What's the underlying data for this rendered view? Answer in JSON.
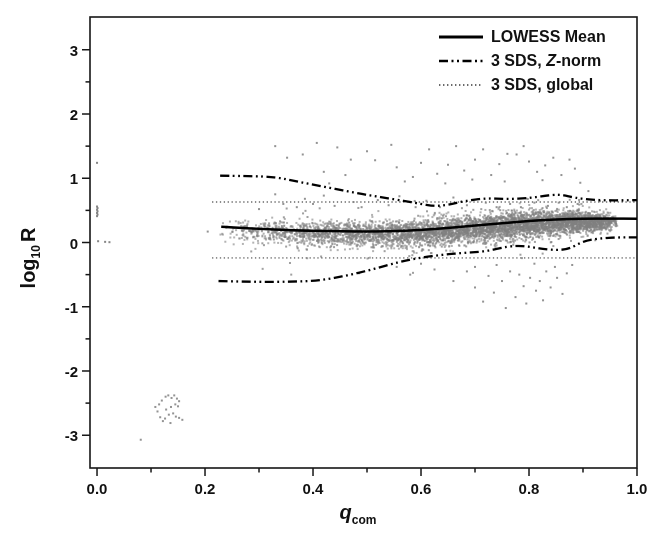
{
  "figure": {
    "background": "#ffffff",
    "frame_color": "#161616",
    "tick_color": "#161616"
  },
  "chart_data": {
    "type": "scatter",
    "title": "",
    "xlabel": "q_com",
    "xlabel_main": "q",
    "xlabel_sub": "com",
    "ylabel": "log10 R",
    "ylabel_main": "log",
    "ylabel_sub": "10",
    "ylabel_suffix": "R",
    "xlim": [
      -0.013,
      1.0
    ],
    "ylim": [
      -3.51,
      3.51
    ],
    "grid": false,
    "x_ticks": [
      {
        "v": 0.0,
        "label": "0.0"
      },
      {
        "v": 0.2,
        "label": "0.2"
      },
      {
        "v": 0.4,
        "label": "0.4"
      },
      {
        "v": 0.6,
        "label": "0.6"
      },
      {
        "v": 0.8,
        "label": "0.8"
      },
      {
        "v": 1.0,
        "label": "1.0"
      }
    ],
    "x_minor_ticks": [
      0.1,
      0.3,
      0.5,
      0.7,
      0.9
    ],
    "y_ticks": [
      {
        "v": 3,
        "label": "3"
      },
      {
        "v": 2,
        "label": "2"
      },
      {
        "v": 1,
        "label": "1"
      },
      {
        "v": 0,
        "label": "0"
      },
      {
        "v": -1,
        "label": "-1"
      },
      {
        "v": -2,
        "label": "-2"
      },
      {
        "v": -3,
        "label": "-3"
      }
    ],
    "y_minor_ticks": [
      2.5,
      1.5,
      0.5,
      -0.5,
      -1.5,
      -2.5
    ],
    "legend": {
      "position": "top-right",
      "entries": [
        {
          "label": "LOWESS Mean",
          "style": "solid"
        },
        {
          "label": "3 SDS, Z-norm",
          "prefix": "3 SDS, ",
          "italic": "Z",
          "suffix": "-norm",
          "style": "dashdotdot"
        },
        {
          "label": "3 SDS, global",
          "style": "dotted"
        }
      ]
    },
    "lines": [
      {
        "name": "3 SDS global upper",
        "style": "dotted",
        "width": 1.2,
        "color": "#4a4a4a",
        "points": [
          [
            0.213,
            0.63
          ],
          [
            1.0,
            0.63
          ]
        ]
      },
      {
        "name": "3 SDS global lower",
        "style": "dotted",
        "width": 1.2,
        "color": "#4a4a4a",
        "points": [
          [
            0.213,
            -0.24
          ],
          [
            1.0,
            -0.24
          ]
        ]
      },
      {
        "name": "3 SDS Z-norm upper",
        "style": "dashdotdot",
        "width": 2.3,
        "color": "#000000",
        "points": [
          [
            0.228,
            1.04
          ],
          [
            0.28,
            1.035
          ],
          [
            0.33,
            1.02
          ],
          [
            0.37,
            0.95
          ],
          [
            0.41,
            0.885
          ],
          [
            0.45,
            0.82
          ],
          [
            0.49,
            0.755
          ],
          [
            0.53,
            0.7
          ],
          [
            0.57,
            0.645
          ],
          [
            0.6,
            0.6
          ],
          [
            0.625,
            0.565
          ],
          [
            0.65,
            0.585
          ],
          [
            0.68,
            0.645
          ],
          [
            0.72,
            0.69
          ],
          [
            0.76,
            0.675
          ],
          [
            0.8,
            0.69
          ],
          [
            0.84,
            0.74
          ],
          [
            0.86,
            0.745
          ],
          [
            0.885,
            0.695
          ],
          [
            0.92,
            0.66
          ],
          [
            0.96,
            0.655
          ],
          [
            1.0,
            0.66
          ]
        ]
      },
      {
        "name": "3 SDS Z-norm lower",
        "style": "dashdotdot",
        "width": 2.3,
        "color": "#000000",
        "points": [
          [
            0.225,
            -0.6
          ],
          [
            0.3,
            -0.615
          ],
          [
            0.36,
            -0.61
          ],
          [
            0.41,
            -0.595
          ],
          [
            0.46,
            -0.52
          ],
          [
            0.51,
            -0.42
          ],
          [
            0.56,
            -0.3
          ],
          [
            0.6,
            -0.235
          ],
          [
            0.64,
            -0.19
          ],
          [
            0.68,
            -0.16
          ],
          [
            0.72,
            -0.14
          ],
          [
            0.76,
            -0.06
          ],
          [
            0.79,
            -0.05
          ],
          [
            0.82,
            -0.095
          ],
          [
            0.85,
            -0.12
          ],
          [
            0.875,
            -0.1
          ],
          [
            0.9,
            0.02
          ],
          [
            0.93,
            0.065
          ],
          [
            0.965,
            0.08
          ],
          [
            1.0,
            0.08
          ]
        ]
      },
      {
        "name": "LOWESS Mean",
        "style": "solid",
        "width": 2.5,
        "color": "#000000",
        "points": [
          [
            0.23,
            0.245
          ],
          [
            0.27,
            0.225
          ],
          [
            0.32,
            0.205
          ],
          [
            0.38,
            0.185
          ],
          [
            0.44,
            0.175
          ],
          [
            0.5,
            0.17
          ],
          [
            0.55,
            0.175
          ],
          [
            0.6,
            0.195
          ],
          [
            0.65,
            0.225
          ],
          [
            0.7,
            0.265
          ],
          [
            0.75,
            0.3
          ],
          [
            0.8,
            0.335
          ],
          [
            0.85,
            0.36
          ],
          [
            0.9,
            0.37
          ],
          [
            0.95,
            0.372
          ],
          [
            1.0,
            0.37
          ]
        ]
      }
    ],
    "scatter": {
      "marker_color": "#808080",
      "marker_size": 2,
      "marker_alpha": 0.6,
      "band": {
        "count": 5200,
        "seed": 1234,
        "x_start": 0.225,
        "x_end": 0.965,
        "x_power": 0.55,
        "taper_start": 0.93,
        "taper_span": 0.042,
        "center_keys": [
          [
            0.225,
            0.195
          ],
          [
            0.3,
            0.165
          ],
          [
            0.4,
            0.135
          ],
          [
            0.5,
            0.125
          ],
          [
            0.6,
            0.145
          ],
          [
            0.7,
            0.215
          ],
          [
            0.8,
            0.285
          ],
          [
            0.88,
            0.32
          ],
          [
            0.965,
            0.325
          ]
        ],
        "sd_keys": [
          [
            0.225,
            0.085
          ],
          [
            0.4,
            0.095
          ],
          [
            0.6,
            0.105
          ],
          [
            0.8,
            0.1
          ],
          [
            0.88,
            0.085
          ],
          [
            0.965,
            0.06
          ]
        ],
        "halo_count": 260,
        "halo_sd_mult": 2.1
      },
      "outliers_above": [
        [
          0.33,
          1.5
        ],
        [
          0.352,
          1.32
        ],
        [
          0.381,
          1.37
        ],
        [
          0.407,
          1.55
        ],
        [
          0.42,
          1.1
        ],
        [
          0.445,
          1.48
        ],
        [
          0.47,
          1.29
        ],
        [
          0.43,
          0.92
        ],
        [
          0.46,
          1.05
        ],
        [
          0.5,
          1.42
        ],
        [
          0.515,
          1.28
        ],
        [
          0.545,
          1.52
        ],
        [
          0.555,
          1.17
        ],
        [
          0.57,
          0.95
        ],
        [
          0.585,
          1.02
        ],
        [
          0.6,
          1.24
        ],
        [
          0.615,
          1.45
        ],
        [
          0.63,
          1.07
        ],
        [
          0.645,
          0.92
        ],
        [
          0.65,
          1.21
        ],
        [
          0.665,
          1.5
        ],
        [
          0.68,
          1.12
        ],
        [
          0.695,
          0.98
        ],
        [
          0.7,
          1.29
        ],
        [
          0.715,
          1.45
        ],
        [
          0.73,
          1.05
        ],
        [
          0.745,
          1.22
        ],
        [
          0.755,
          0.95
        ],
        [
          0.76,
          1.38
        ],
        [
          0.777,
          1.37
        ],
        [
          0.79,
          1.5
        ],
        [
          0.8,
          1.26
        ],
        [
          0.815,
          1.1
        ],
        [
          0.825,
          0.97
        ],
        [
          0.83,
          1.2
        ],
        [
          0.845,
          1.32
        ],
        [
          0.86,
          1.05
        ],
        [
          0.875,
          1.29
        ],
        [
          0.885,
          1.15
        ],
        [
          0.895,
          0.93
        ],
        [
          0.91,
          0.8
        ],
        [
          0.3,
          0.52
        ],
        [
          0.33,
          0.75
        ],
        [
          0.345,
          0.6
        ],
        [
          0.37,
          0.55
        ],
        [
          0.385,
          0.68
        ],
        [
          0.4,
          0.6
        ],
        [
          0.42,
          0.73
        ],
        [
          0.44,
          0.57
        ],
        [
          0.475,
          0.63
        ],
        [
          0.49,
          0.55
        ],
        [
          0.52,
          0.66
        ],
        [
          0.54,
          0.58
        ],
        [
          0.56,
          0.72
        ],
        [
          0.59,
          0.55
        ],
        [
          0.61,
          0.65
        ],
        [
          0.635,
          0.55
        ],
        [
          0.66,
          0.7
        ],
        [
          0.685,
          0.58
        ],
        [
          0.72,
          0.62
        ],
        [
          0.74,
          0.55
        ],
        [
          0.765,
          0.6
        ],
        [
          0.785,
          0.55
        ],
        [
          0.81,
          0.62
        ],
        [
          0.835,
          0.57
        ],
        [
          0.855,
          0.62
        ],
        [
          0.87,
          0.55
        ],
        [
          0.89,
          0.6
        ]
      ],
      "outliers_below": [
        [
          0.555,
          -0.38
        ],
        [
          0.58,
          -0.5
        ],
        [
          0.6,
          -0.33
        ],
        [
          0.625,
          -0.42
        ],
        [
          0.66,
          -0.6
        ],
        [
          0.685,
          -0.45
        ],
        [
          0.7,
          -0.7
        ],
        [
          0.715,
          -0.92
        ],
        [
          0.725,
          -0.52
        ],
        [
          0.735,
          -0.78
        ],
        [
          0.75,
          -0.6
        ],
        [
          0.757,
          -1.02
        ],
        [
          0.765,
          -0.45
        ],
        [
          0.775,
          -0.85
        ],
        [
          0.782,
          -0.5
        ],
        [
          0.79,
          -0.68
        ],
        [
          0.795,
          -0.95
        ],
        [
          0.802,
          -0.55
        ],
        [
          0.81,
          -0.33
        ],
        [
          0.813,
          -0.75
        ],
        [
          0.82,
          -0.6
        ],
        [
          0.826,
          -0.9
        ],
        [
          0.832,
          -0.45
        ],
        [
          0.84,
          -0.7
        ],
        [
          0.848,
          -0.38
        ],
        [
          0.852,
          -0.55
        ],
        [
          0.862,
          -0.8
        ],
        [
          0.87,
          -0.48
        ],
        [
          0.88,
          -0.35
        ],
        [
          0.74,
          -0.35
        ],
        [
          0.7,
          -0.38
        ]
      ],
      "left_cluster": [
        [
          0.081,
          -3.07
        ],
        [
          0.115,
          -2.52
        ],
        [
          0.12,
          -2.46
        ],
        [
          0.127,
          -2.4
        ],
        [
          0.132,
          -2.38
        ],
        [
          0.138,
          -2.42
        ],
        [
          0.143,
          -2.38
        ],
        [
          0.148,
          -2.43
        ],
        [
          0.152,
          -2.47
        ],
        [
          0.145,
          -2.52
        ],
        [
          0.15,
          -2.55
        ],
        [
          0.137,
          -2.56
        ],
        [
          0.128,
          -2.6
        ],
        [
          0.112,
          -2.63
        ],
        [
          0.117,
          -2.72
        ],
        [
          0.126,
          -2.74
        ],
        [
          0.133,
          -2.68
        ],
        [
          0.141,
          -2.66
        ],
        [
          0.146,
          -2.71
        ],
        [
          0.152,
          -2.73
        ],
        [
          0.158,
          -2.76
        ],
        [
          0.136,
          -2.81
        ],
        [
          0.122,
          -2.78
        ],
        [
          0.108,
          -2.56
        ]
      ],
      "left_edge": [
        [
          0.0,
          1.24
        ],
        [
          0.0,
          0.56
        ],
        [
          0.001,
          0.535
        ],
        [
          0.0,
          0.51
        ],
        [
          0.001,
          0.485
        ],
        [
          0.0,
          0.46
        ],
        [
          0.001,
          0.435
        ],
        [
          0.0,
          0.41
        ],
        [
          0.002,
          0.02
        ],
        [
          0.015,
          0.01
        ],
        [
          0.023,
          0.005
        ]
      ],
      "isolated": [
        [
          0.205,
          0.17
        ]
      ]
    }
  }
}
